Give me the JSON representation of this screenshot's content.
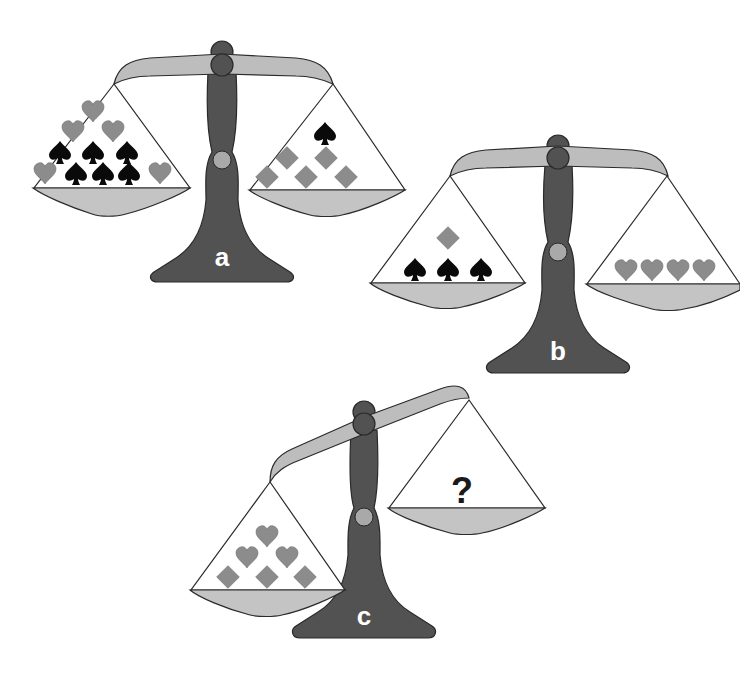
{
  "puzzle": {
    "type": "balance-scale-puzzle",
    "colors": {
      "stand": "#525252",
      "beam": "#bdbdbd",
      "pan": "#c4c4c4",
      "knuckle": "#a9a9a9",
      "outline": "#2a2a2a",
      "heart": "#8c8c8c",
      "diamond": "#8c8c8c",
      "spade": "#0a0a0a",
      "question": "#1a1a1a",
      "label": "#ffffff"
    },
    "scales": [
      {
        "id": "a",
        "label": "a",
        "state": "balanced",
        "left_pan": {
          "hearts": 5,
          "spades": 6,
          "diamonds": 0
        },
        "right_pan": {
          "hearts": 0,
          "spades": 1,
          "diamonds": 5
        }
      },
      {
        "id": "b",
        "label": "b",
        "state": "balanced",
        "left_pan": {
          "hearts": 0,
          "spades": 3,
          "diamonds": 1
        },
        "right_pan": {
          "hearts": 4,
          "spades": 0,
          "diamonds": 0
        }
      },
      {
        "id": "c",
        "label": "c",
        "state": "left-heavy",
        "left_pan": {
          "hearts": 3,
          "spades": 0,
          "diamonds": 3
        },
        "right_pan": {
          "unknown": "?"
        }
      }
    ]
  }
}
